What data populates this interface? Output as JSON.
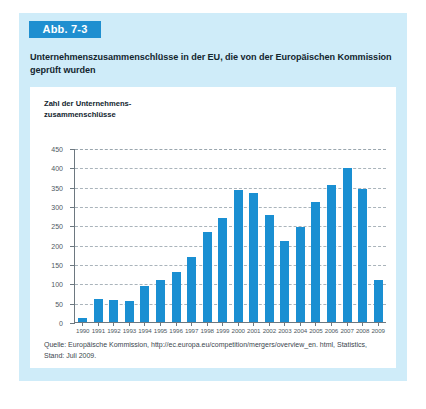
{
  "figure": {
    "badge_label": "Abb. 7-3",
    "title": "Unternehmenszusammenschlüsse in der EU, die von der Europäischen Kommission geprüft wurden",
    "source_note": "Quelle: Europäische Kommission, http://ec.europa.eu/competition/mergers/overview_en. html, Statistics, Stand: Juli 2009."
  },
  "colors": {
    "panel_background": "#cfecf9",
    "badge_background": "#1f8fd0",
    "bar": "#1a8fd2",
    "card_background": "#ffffff",
    "gridline": "#aab4bb",
    "axis": "#6d7880"
  },
  "chart_data": {
    "type": "bar",
    "title": "Unternehmenszusammenschlüsse in der EU, die von der Europäischen Kommission geprüft wurden",
    "ylabel": "Zahl der Unternehmens-\nzusammenschlüsse",
    "xlabel": "",
    "ylim": [
      0,
      450
    ],
    "yticks": [
      0,
      50,
      100,
      150,
      200,
      250,
      300,
      350,
      400,
      450
    ],
    "ytick_labels": [
      "0",
      "50",
      "100",
      "150",
      "200",
      "250",
      "300",
      "350",
      "400",
      "450"
    ],
    "grid": true,
    "legend": false,
    "categories": [
      "1990",
      "1991",
      "1992",
      "1993",
      "1994",
      "1995",
      "1996",
      "1997",
      "1998",
      "1999",
      "2000",
      "2001",
      "2002",
      "2003",
      "2004",
      "2005",
      "2006",
      "2007",
      "2008",
      "2009"
    ],
    "values": [
      12,
      63,
      60,
      58,
      95,
      110,
      131,
      172,
      235,
      272,
      345,
      335,
      279,
      212,
      249,
      313,
      356,
      402,
      347,
      112
    ]
  }
}
